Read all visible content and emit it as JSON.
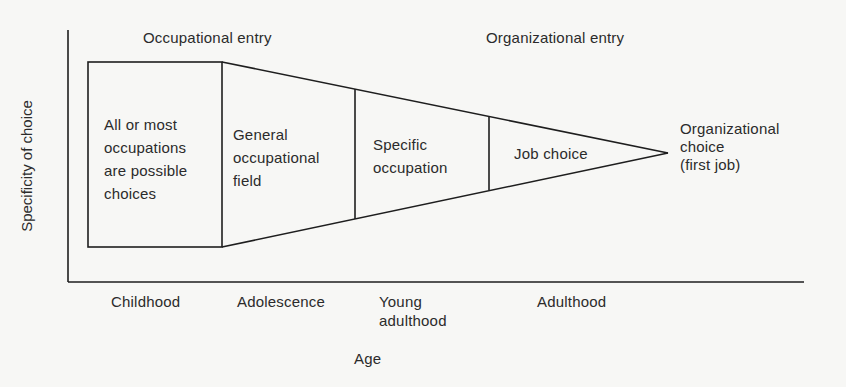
{
  "diagram": {
    "y_axis_label": "Specificity of choice",
    "x_axis_label": "Age",
    "top_labels": {
      "occupational_entry": "Occupational entry",
      "organizational_entry": "Organizational entry"
    },
    "stages": [
      {
        "id": "all-occupations",
        "text": "All or most\noccupations\nare possible\nchoices"
      },
      {
        "id": "general-field",
        "text": "General\noccupational\nfield"
      },
      {
        "id": "specific-occupation",
        "text": "Specific\noccupation"
      },
      {
        "id": "job-choice",
        "text": "Job choice"
      }
    ],
    "endpoint_label": "Organizational\nchoice\n(first job)",
    "age_periods": [
      {
        "id": "childhood",
        "text": "Childhood"
      },
      {
        "id": "adolescence",
        "text": "Adolescence"
      },
      {
        "id": "young-adulthood",
        "text": "Young\nadulthood"
      },
      {
        "id": "adulthood",
        "text": "Adulthood"
      }
    ],
    "colors": {
      "line": "#1e1e1e",
      "text": "#2b2b2b",
      "background": "#f7f7f5"
    }
  }
}
